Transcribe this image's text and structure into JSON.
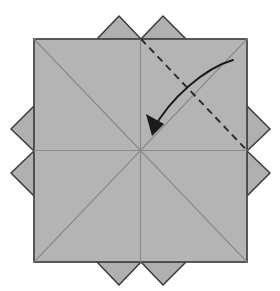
{
  "figure": {
    "background_color": "#ffffff"
  },
  "colors": {
    "paper_fill": "#b4b4b4",
    "flap_fill": "#b0b0b0",
    "paper_outline": "#4a4a4a",
    "flap_outline": "#3f3f3f",
    "crease_line": "#8a8a8a",
    "fold_line": "#2b2b2b",
    "arrow": "#1a1a1a"
  },
  "geometry": {
    "square": {
      "left": 34,
      "top": 39,
      "right": 247,
      "bottom": 262,
      "center_x": 140.5,
      "center_y": 150.5,
      "stroke_width": 1.8
    },
    "flaps": [
      {
        "name": "flap-top-left",
        "points": "97,39 119,16 141,39"
      },
      {
        "name": "flap-top-right",
        "points": "141,39 163,16 186,39"
      },
      {
        "name": "flap-right-upper",
        "points": "247,106 270,129 247,151"
      },
      {
        "name": "flap-right-lower",
        "points": "247,151 270,173 247,196"
      },
      {
        "name": "flap-bottom-right",
        "points": "186,262 163,285 141,262"
      },
      {
        "name": "flap-bottom-left",
        "points": "141,262 119,285 97,262"
      },
      {
        "name": "flap-left-lower",
        "points": "34,196 11,173 34,151"
      },
      {
        "name": "flap-left-upper",
        "points": "34,151 11,129 34,106"
      }
    ],
    "creases": [
      {
        "name": "crease-diagonal-nw-se",
        "x1": 34,
        "y1": 39,
        "x2": 247,
        "y2": 262
      },
      {
        "name": "crease-diagonal-ne-sw",
        "x1": 247,
        "y1": 39,
        "x2": 34,
        "y2": 262
      },
      {
        "name": "crease-horizontal",
        "x1": 34,
        "y1": 150.5,
        "x2": 247,
        "y2": 150.5
      },
      {
        "name": "crease-vertical",
        "x1": 140.5,
        "y1": 39,
        "x2": 140.5,
        "y2": 262
      }
    ],
    "fold_line": {
      "name": "dashed-fold-line",
      "x1": 141,
      "y1": 39,
      "x2": 247,
      "y2": 150.5,
      "dash_pattern": "7,5",
      "stroke_width": 1.9
    },
    "arrow": {
      "name": "fold-direction-arrow",
      "path": "M 233,60 C 205,68 170,98 153,130",
      "stroke_width": 1.9,
      "head_points": "153,135 147,116 163,123",
      "start_x": 233,
      "start_y": 60,
      "end_x": 153,
      "end_y": 133
    }
  }
}
